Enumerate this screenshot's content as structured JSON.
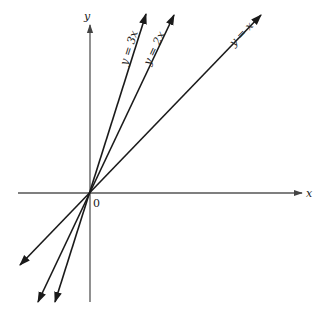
{
  "diagram": {
    "title": "",
    "axes": {
      "x_label": "x",
      "y_label": "y",
      "origin_label": "0",
      "color": "#555555"
    },
    "lines": [
      {
        "name": "y-equals-3x",
        "label": "y = 3x",
        "slope": 3,
        "color": "#1a1a1a"
      },
      {
        "name": "y-equals-2x",
        "label": "y = 2x",
        "slope": 2,
        "color": "#1a1a1a"
      },
      {
        "name": "y-equals-x",
        "label": "y = x",
        "slope": 1,
        "color": "#1a1a1a"
      }
    ]
  }
}
